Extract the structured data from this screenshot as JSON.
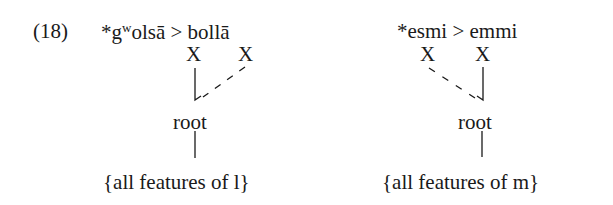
{
  "example_number": "(18)",
  "left": {
    "form_prefix": "*g",
    "form_sup": "w",
    "form_rest": "olsā > bollā",
    "x1": "X",
    "x2": "X",
    "root": "root",
    "features": "{all features of l}"
  },
  "right": {
    "form": "*esmi > emmi",
    "x1": "X",
    "x2": "X",
    "root": "root",
    "features": "{all features of m}"
  }
}
